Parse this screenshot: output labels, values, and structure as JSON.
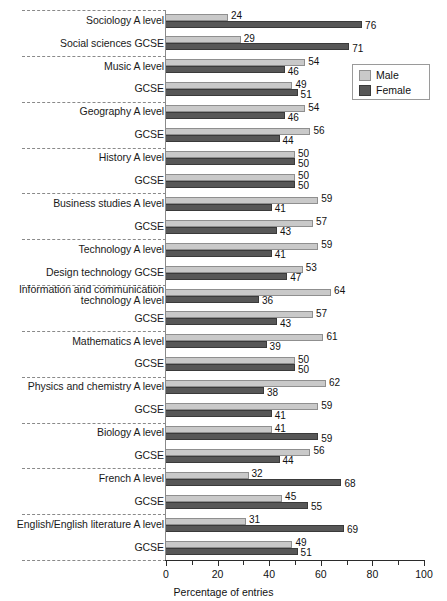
{
  "chart_data": {
    "type": "bar",
    "orientation": "horizontal",
    "title": "",
    "xlabel": "Percentage of entries",
    "ylabel": "",
    "xlim": [
      0,
      100
    ],
    "xticks": [
      0,
      20,
      40,
      60,
      80,
      100
    ],
    "xtick_labels": [
      "0",
      "20",
      "40",
      "60",
      "80",
      "100"
    ],
    "minor_ticks": [
      10,
      30,
      50,
      70,
      90
    ],
    "grid": false,
    "legend_position": "top-right",
    "series": [
      {
        "name": "Male",
        "color": "#c9c9c9",
        "values": [
          24,
          29,
          54,
          49,
          54,
          56,
          50,
          50,
          59,
          57,
          59,
          53,
          64,
          57,
          61,
          50,
          62,
          59,
          41,
          56,
          32,
          45,
          31,
          49
        ]
      },
      {
        "name": "Female",
        "color": "#575757",
        "values": [
          76,
          71,
          46,
          51,
          46,
          44,
          50,
          50,
          41,
          43,
          41,
          47,
          36,
          43,
          39,
          50,
          38,
          41,
          59,
          44,
          68,
          55,
          69,
          51
        ]
      }
    ],
    "categories": [
      "Sociology A level",
      "Social sciences GCSE",
      "Music A level",
      "GCSE",
      "Geography A level",
      "GCSE",
      "History A level",
      "GCSE",
      "Business studies A level",
      "GCSE",
      "Technology A level",
      "Design technology GCSE",
      "Information and communication\ntechnology A level",
      "GCSE",
      "Mathematics A level",
      "GCSE",
      "Physics and chemistry A level",
      "GCSE",
      "Biology A level",
      "GCSE",
      "French A level",
      "GCSE",
      "English/English literature A level",
      "GCSE"
    ],
    "rows": [
      {
        "label": "Sociology A level",
        "male": 24,
        "female": 76,
        "group": 0
      },
      {
        "label": "Social sciences GCSE",
        "male": 29,
        "female": 71,
        "group": 0
      },
      {
        "label": "Music A level",
        "male": 54,
        "female": 46,
        "group": 1
      },
      {
        "label": "GCSE",
        "male": 49,
        "female": 51,
        "group": 1
      },
      {
        "label": "Geography A level",
        "male": 54,
        "female": 46,
        "group": 2
      },
      {
        "label": "GCSE",
        "male": 56,
        "female": 44,
        "group": 2
      },
      {
        "label": "History A level",
        "male": 50,
        "female": 50,
        "group": 3
      },
      {
        "label": "GCSE",
        "male": 50,
        "female": 50,
        "group": 3
      },
      {
        "label": "Business studies A level",
        "male": 59,
        "female": 41,
        "group": 4
      },
      {
        "label": "GCSE",
        "male": 57,
        "female": 43,
        "group": 4
      },
      {
        "label": "Technology A level",
        "male": 59,
        "female": 41,
        "group": 5
      },
      {
        "label": "Design technology GCSE",
        "male": 53,
        "female": 47,
        "group": 5
      },
      {
        "label": "Information and communication\ntechnology A level",
        "male": 64,
        "female": 36,
        "group": 6
      },
      {
        "label": "GCSE",
        "male": 57,
        "female": 43,
        "group": 6
      },
      {
        "label": "Mathematics A level",
        "male": 61,
        "female": 39,
        "group": 7
      },
      {
        "label": "GCSE",
        "male": 50,
        "female": 50,
        "group": 7
      },
      {
        "label": "Physics and chemistry A level",
        "male": 62,
        "female": 38,
        "group": 8
      },
      {
        "label": "GCSE",
        "male": 59,
        "female": 41,
        "group": 8
      },
      {
        "label": "Biology A level",
        "male": 41,
        "female": 59,
        "group": 9
      },
      {
        "label": "GCSE",
        "male": 56,
        "female": 44,
        "group": 9
      },
      {
        "label": "French A level",
        "male": 32,
        "female": 68,
        "group": 10
      },
      {
        "label": "GCSE",
        "male": 45,
        "female": 55,
        "group": 10
      },
      {
        "label": "English/English literature A level",
        "male": 31,
        "female": 69,
        "group": 11
      },
      {
        "label": "GCSE",
        "male": 49,
        "female": 51,
        "group": 11
      }
    ]
  },
  "legend": {
    "items": [
      {
        "label": "Male",
        "color": "#c9c9c9"
      },
      {
        "label": "Female",
        "color": "#575757"
      }
    ]
  },
  "axis": {
    "title": "Percentage of entries",
    "tick_labels": [
      "0",
      "20",
      "40",
      "60",
      "80",
      "100"
    ]
  }
}
